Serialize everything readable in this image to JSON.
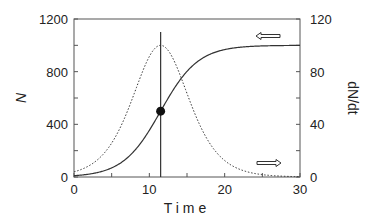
{
  "chart_data": {
    "type": "line",
    "title": "",
    "xlabel": "Time",
    "ylabel_left": "N",
    "ylabel_right": "dN/dt",
    "xlim": [
      0,
      30
    ],
    "ylim_left": [
      0,
      1200
    ],
    "ylim_right": [
      0,
      120
    ],
    "x_ticks": [
      0,
      10,
      20,
      30
    ],
    "x_minor_ticks": [
      5,
      15,
      25
    ],
    "y_left_ticks": [
      0,
      400,
      800,
      1200
    ],
    "y_left_minor_ticks": [
      200,
      600,
      1000
    ],
    "y_right_ticks": [
      0,
      40,
      80,
      120
    ],
    "y_right_minor_ticks": [
      20,
      60,
      100
    ],
    "grid": false,
    "series": [
      {
        "name": "N",
        "axis": "left",
        "style": "solid",
        "model": "logistic",
        "K": 1000,
        "r": 0.4,
        "t_inflection": 11.5,
        "x": [
          0,
          2,
          4,
          6,
          8,
          10,
          11.5,
          13,
          15,
          17,
          20,
          25,
          30
        ],
        "values": [
          10,
          22,
          47,
          100,
          198,
          354,
          500,
          646,
          802,
          900,
          967,
          995,
          999
        ]
      },
      {
        "name": "dN/dt",
        "axis": "right",
        "style": "dotted",
        "x": [
          0,
          2,
          4,
          6,
          8,
          10,
          11.5,
          13,
          15,
          17,
          20,
          25,
          30
        ],
        "values": [
          4,
          9,
          18,
          36,
          64,
          91,
          100,
          91,
          64,
          36,
          13,
          2,
          0
        ]
      }
    ],
    "annotations": [
      {
        "type": "vline",
        "x": 11.5,
        "label": "inflection time"
      },
      {
        "type": "point",
        "x": 11.5,
        "y": 500,
        "axis": "left",
        "label": "inflection point (K/2)"
      },
      {
        "type": "arrow",
        "direction": "left",
        "near": "N curve",
        "meaning": "N uses left axis"
      },
      {
        "type": "arrow",
        "direction": "right",
        "near": "dN/dt curve",
        "meaning": "dN/dt uses right axis"
      }
    ]
  },
  "labels": {
    "xlabel": "Time",
    "ylabel_left": "N",
    "ylabel_right": "dN/dt"
  },
  "colors": {
    "line": "#333333",
    "axis": "#555555"
  }
}
